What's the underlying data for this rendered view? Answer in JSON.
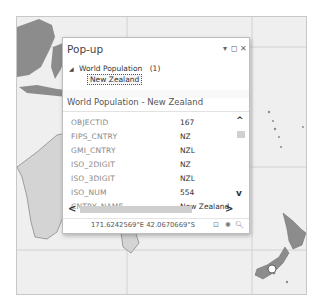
{
  "map": {
    "background": "#efefef",
    "land_color": "#8c8c8c",
    "light_land_color": "#d4d4d4",
    "grid_color": "#d0d0d0"
  },
  "popup": {
    "title": "Pop-up",
    "controls": {
      "menu_icon": "▾",
      "restore_icon": "◻",
      "close_icon": "✕"
    },
    "tree": {
      "layer_name": "World Population",
      "layer_count": "(1)",
      "expand_icon": "◢",
      "features": [
        {
          "label": "New Zealand"
        }
      ]
    },
    "section_title": "World Population  - New Zealand",
    "attributes": [
      {
        "key": "OBJECTID",
        "value": "167"
      },
      {
        "key": "FIPS_CNTRY",
        "value": "NZ"
      },
      {
        "key": "GMI_CNTRY",
        "value": "NZL"
      },
      {
        "key": "ISO_2DIGIT",
        "value": "NZ"
      },
      {
        "key": "ISO_3DIGIT",
        "value": "NZL"
      },
      {
        "key": "ISO_NUM",
        "value": "554"
      },
      {
        "key": "CNTRY_NAME",
        "value": "New Zealand"
      }
    ],
    "scroll": {
      "up_icon": "^",
      "down_icon": "v",
      "left_icon": "<",
      "right_icon": ">"
    },
    "footer": {
      "coordinates": "171.6242569°E 42.0670669°S",
      "icons": [
        "zoom-to-icon",
        "flash-icon",
        "pan-to-icon"
      ],
      "icon_glyphs": [
        "⊡",
        "✺",
        "🔍︎"
      ]
    }
  }
}
